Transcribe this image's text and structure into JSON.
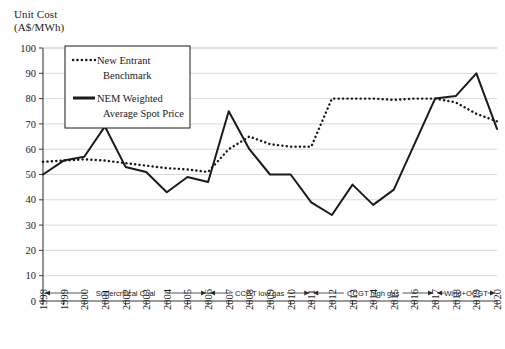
{
  "chart_data": {
    "type": "line",
    "title": "",
    "ylabel": "Unit Cost\n(A$/MWh)",
    "xlabel": "",
    "ylim": [
      0,
      100
    ],
    "yticks": [
      0,
      10,
      20,
      30,
      40,
      50,
      60,
      70,
      80,
      90,
      100
    ],
    "grid": true,
    "legend_position": "top-center-inside",
    "categories": [
      "1998",
      "1999",
      "2000",
      "2001",
      "2002",
      "2003",
      "2004",
      "2005",
      "2006",
      "2007",
      "2008",
      "2009",
      "2010",
      "2011",
      "2012",
      "2013",
      "2014",
      "2015",
      "2016",
      "2017",
      "2018",
      "2019",
      "2020"
    ],
    "series": [
      {
        "name": "New Entrant Benchmark",
        "style": "dotted",
        "color": "#1a1a1a",
        "values": [
          55,
          55.5,
          56,
          55.5,
          54.5,
          53.5,
          52.5,
          52,
          51,
          60,
          65,
          62,
          61,
          61,
          80,
          80,
          80,
          79.5,
          80,
          80,
          78.5,
          74,
          71
        ]
      },
      {
        "name": "NEM Weighted Average Spot Price",
        "style": "solid",
        "color": "#1a1a1a",
        "values": [
          50,
          55.5,
          57,
          69,
          53,
          51,
          43,
          49,
          47,
          75,
          60,
          50,
          50,
          39,
          34,
          46,
          38,
          44,
          62,
          80,
          81,
          90,
          68
        ]
      }
    ],
    "annotation_bands": [
      {
        "label": "Supercritical Coal",
        "start": "1998",
        "end": "2006"
      },
      {
        "label": "CCGT low gas",
        "start": "2006",
        "end": "2011"
      },
      {
        "label": "CCGT high gas",
        "start": "2011",
        "end": "2017"
      },
      {
        "label": "Wind+OCGT",
        "start": "2017",
        "end": "2020"
      }
    ]
  },
  "legend": {
    "entries": [
      {
        "label_line1": "New Entrant",
        "label_line2": "Benchmark"
      },
      {
        "label_line1": "NEM Weighted",
        "label_line2": "Average Spot Price"
      }
    ]
  }
}
